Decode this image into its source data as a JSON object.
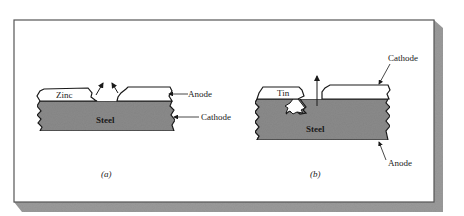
{
  "figure": {
    "panels": [
      {
        "id": "a",
        "caption": "(a)",
        "coating_label": "Zinc",
        "substrate_label": "Steel",
        "callouts": [
          {
            "label": "Anode",
            "target": "zinc-coating"
          },
          {
            "label": "Cathode",
            "target": "steel-substrate"
          }
        ]
      },
      {
        "id": "b",
        "caption": "(b)",
        "coating_label": "Tin",
        "substrate_label": "Steel",
        "callouts": [
          {
            "label": "Cathode",
            "target": "tin-coating"
          },
          {
            "label": "Anode",
            "target": "steel-substrate"
          }
        ]
      }
    ]
  },
  "colors": {
    "steel_fill": "#8a8a8a",
    "coating_fill": "#ffffff",
    "outline": "#1a1a1a",
    "frame_shadow": "#9a9a9a",
    "background": "#ffffff"
  }
}
